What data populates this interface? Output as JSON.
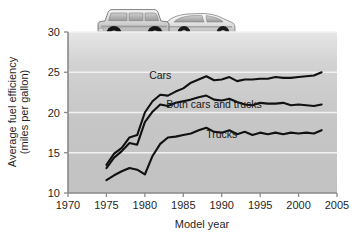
{
  "figure": {
    "name": "fuel-efficiency-line-chart",
    "photo_caption": "station-wagon-and-sedan-photo"
  },
  "chart_data": {
    "type": "line",
    "title": "",
    "xlabel": "Model year",
    "ylabel": "Average fuel efficiency (miles per gallon)",
    "ylabel_line1": "Average fuel efficiency",
    "ylabel_line2": "(miles per gallon)",
    "xlim": [
      1970,
      2005
    ],
    "ylim": [
      10,
      30
    ],
    "xticks": [
      1970,
      1975,
      1980,
      1985,
      1990,
      1995,
      2000,
      2005
    ],
    "yticks": [
      10,
      15,
      20,
      25,
      30
    ],
    "xtick_labels": [
      "1970",
      "1975",
      "1980",
      "1985",
      "1990",
      "1995",
      "2000",
      "2005"
    ],
    "ytick_labels": [
      "10",
      "15",
      "20",
      "25",
      "30"
    ],
    "grid": true,
    "grid_color": "#f2f2f2",
    "plot_background": "#c9c9c9",
    "line_color": "#111111",
    "legend": "inline-labels",
    "x": [
      1975,
      1976,
      1977,
      1978,
      1979,
      1980,
      1981,
      1982,
      1983,
      1984,
      1985,
      1986,
      1987,
      1988,
      1989,
      1990,
      1991,
      1992,
      1993,
      1994,
      1995,
      1996,
      1997,
      1998,
      1999,
      2000,
      2001,
      2002,
      2003
    ],
    "series": [
      {
        "name": "Cars",
        "label": "Cars",
        "values": [
          13.5,
          14.9,
          15.6,
          16.9,
          17.2,
          20.0,
          21.4,
          22.2,
          22.1,
          22.6,
          23.0,
          23.7,
          24.1,
          24.5,
          24.0,
          24.1,
          24.4,
          23.9,
          24.1,
          24.1,
          24.2,
          24.2,
          24.4,
          24.3,
          24.3,
          24.4,
          24.5,
          24.6,
          25.0
        ]
      },
      {
        "name": "Both cars and trucks",
        "label": "Both cars and trucks",
        "values": [
          13.1,
          14.4,
          15.2,
          16.2,
          16.0,
          18.8,
          20.1,
          21.0,
          20.8,
          21.2,
          21.4,
          21.6,
          21.9,
          22.1,
          21.6,
          21.5,
          21.7,
          21.3,
          21.0,
          20.9,
          21.2,
          21.1,
          21.1,
          21.2,
          20.9,
          21.0,
          20.9,
          20.8,
          21.0
        ]
      },
      {
        "name": "Trucks",
        "label": "Trucks",
        "values": [
          11.6,
          12.2,
          12.7,
          13.1,
          12.9,
          12.3,
          14.6,
          16.1,
          16.9,
          17.0,
          17.2,
          17.4,
          17.8,
          18.1,
          17.6,
          17.5,
          17.8,
          17.3,
          17.6,
          17.2,
          17.5,
          17.3,
          17.5,
          17.3,
          17.5,
          17.4,
          17.5,
          17.4,
          17.8
        ]
      }
    ],
    "annotations": [
      {
        "text": "Cars",
        "x": 1982.0,
        "y": 24.2
      },
      {
        "text": "Both cars and trucks",
        "x": 1989.0,
        "y": 20.5
      },
      {
        "text": "Trucks",
        "x": 1990.0,
        "y": 16.8
      }
    ]
  }
}
